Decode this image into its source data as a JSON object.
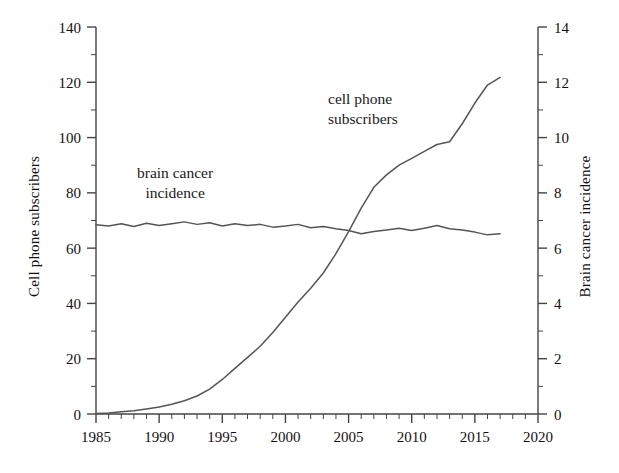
{
  "figure": {
    "background": "#ffffff",
    "line_color": "#555555",
    "axis_color": "#444444",
    "text_color": "#111111"
  },
  "axes": {
    "x": {
      "label": "",
      "min": 1985,
      "max": 2020,
      "major_step": 5,
      "minor_step": 1,
      "ticks": [
        "1985",
        "1990",
        "1995",
        "2000",
        "2005",
        "2010",
        "2015",
        "2020"
      ]
    },
    "y_left": {
      "label": "Cell phone subscribers",
      "min": 0,
      "max": 140,
      "major_step": 20,
      "minor_step": 10,
      "ticks": [
        "0",
        "20",
        "40",
        "60",
        "80",
        "100",
        "120",
        "140"
      ]
    },
    "y_right": {
      "label": "Brain cancer incidence",
      "min": 0,
      "max": 14,
      "major_step": 2,
      "minor_step": 1,
      "ticks": [
        "0",
        "2",
        "4",
        "6",
        "8",
        "10",
        "12",
        "14"
      ]
    }
  },
  "annotations": {
    "cell_phone": {
      "line1": "cell phone",
      "line2": "subscribers"
    },
    "brain_cancer": {
      "line1": "brain cancer",
      "line2": "incidence"
    }
  },
  "chart_data": {
    "type": "line",
    "title": "",
    "xlabel": "",
    "ylabel": "Cell phone subscribers",
    "ylabel_secondary": "Brain cancer incidence",
    "xlim": [
      1985,
      2020
    ],
    "ylim": [
      0,
      140
    ],
    "ylim_secondary": [
      0,
      14
    ],
    "grid": false,
    "legend": "inline-annotations",
    "x": [
      1985,
      1986,
      1987,
      1988,
      1989,
      1990,
      1991,
      1992,
      1993,
      1994,
      1995,
      1996,
      1997,
      1998,
      1999,
      2000,
      2001,
      2002,
      2003,
      2004,
      2005,
      2006,
      2007,
      2008,
      2009,
      2010,
      2011,
      2012,
      2013,
      2014,
      2015,
      2016,
      2017
    ],
    "series": [
      {
        "name": "cell phone subscribers",
        "axis": "left",
        "units": "subscribers per 100 people",
        "values": [
          0.2,
          0.4,
          0.8,
          1.2,
          1.8,
          2.5,
          3.5,
          4.8,
          6.5,
          9.0,
          12.5,
          16.5,
          20.5,
          24.5,
          29.5,
          35.0,
          40.5,
          45.5,
          51.0,
          58.0,
          66.0,
          74.5,
          82.0,
          86.5,
          90.0,
          92.5,
          95.0,
          97.5,
          98.5,
          105.0,
          112.5,
          119.0,
          121.8
        ]
      },
      {
        "name": "brain cancer incidence",
        "axis": "right",
        "units": "cases per 100,000 people",
        "values": [
          6.85,
          6.8,
          6.88,
          6.78,
          6.9,
          6.82,
          6.88,
          6.95,
          6.86,
          6.92,
          6.8,
          6.88,
          6.82,
          6.86,
          6.76,
          6.8,
          6.86,
          6.74,
          6.78,
          6.7,
          6.64,
          6.52,
          6.6,
          6.66,
          6.72,
          6.64,
          6.72,
          6.82,
          6.7,
          6.66,
          6.58,
          6.48,
          6.52
        ]
      }
    ]
  }
}
